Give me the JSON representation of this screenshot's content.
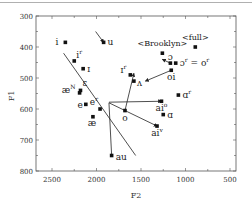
{
  "chart_data": {
    "type": "scatter",
    "title": "",
    "xlabel": "F2",
    "ylabel": "F1",
    "xlim": [
      2700,
      500
    ],
    "ylim": [
      800,
      300
    ],
    "x_reversed": true,
    "y_reversed": true,
    "xticks": [
      "2500",
      "2000",
      "1500",
      "1000",
      "500"
    ],
    "yticks": [
      "300",
      "400",
      "500",
      "600",
      "700",
      "800"
    ],
    "grid": false,
    "annotations": [
      "<Brooklyn>",
      "<full>"
    ],
    "points": [
      {
        "label": "i",
        "sup": "",
        "F2": 2350,
        "F1": 385
      },
      {
        "label": "i",
        "sup": "r",
        "F2": 2250,
        "F1": 445
      },
      {
        "label": "ɪ",
        "sup": "",
        "F2": 2150,
        "F1": 470
      },
      {
        "label": "ɛ",
        "sup": "",
        "F2": 2180,
        "F1": 540
      },
      {
        "label": "æ",
        "sup": "N",
        "F2": 2190,
        "F1": 548
      },
      {
        "label": "e",
        "sup": "",
        "F2": 2120,
        "F1": 585
      },
      {
        "label": "e",
        "sup": "r",
        "F2": 1960,
        "F1": 600
      },
      {
        "label": "æ",
        "sup": "",
        "F2": 2040,
        "F1": 625
      },
      {
        "label": "u",
        "sup": "",
        "F2": 1920,
        "F1": 385
      },
      {
        "label": "ɪ",
        "sup": "r",
        "F2": 1620,
        "F1": 490
      },
      {
        "label": "ʌ",
        "sup": "",
        "F2": 1580,
        "F1": 510
      },
      {
        "label": "o",
        "sup": "",
        "F2": 1680,
        "F1": 605
      },
      {
        "label": "au",
        "sup": "",
        "F2": 1830,
        "F1": 750
      },
      {
        "label": "ɔ",
        "sup": "",
        "F2": 1170,
        "F1": 452
      },
      {
        "label": "ɔ",
        "sup": "r",
        "suffix": " = o",
        "suffix_sup": "r",
        "F2": 1110,
        "F1": 452
      },
      {
        "label": "oi",
        "sup": "",
        "F2": 1160,
        "F1": 475
      },
      {
        "label": "ɑ",
        "sup": "r",
        "F2": 1080,
        "F1": 555
      },
      {
        "label": "ai",
        "sup": "o",
        "F2": 1270,
        "F1": 575
      },
      {
        "label": "ɑ",
        "sup": "",
        "F2": 1250,
        "F1": 618
      },
      {
        "label": "ai",
        "sup": "v",
        "F2": 1320,
        "F1": 655
      },
      {
        "label": "<Brooklyn>",
        "sup": "",
        "F2": 1260,
        "F1": 420
      },
      {
        "label": "<full>",
        "sup": "",
        "F2": 890,
        "F1": 400
      }
    ],
    "trajectories": [
      {
        "from": "u",
        "from_xy": [
          2010,
          350
        ],
        "to_xy": [
          1920,
          385
        ]
      },
      {
        "from": "i-line",
        "from_xy": [
          2370,
          420
        ],
        "to_xy": [
          1560,
          750
        ]
      },
      {
        "from": "au",
        "from_xy": [
          1830,
          750
        ],
        "to_xy": [
          1860,
          580
        ]
      },
      {
        "from": "o-to-ai-v",
        "from_xy": [
          1860,
          580
        ],
        "to_xy": [
          1320,
          655
        ]
      },
      {
        "from": "o",
        "from_xy": [
          1680,
          605
        ],
        "to_xy": [
          1580,
          485
        ]
      },
      {
        "from": "ai-o",
        "from_xy": [
          1860,
          578
        ],
        "to_xy": [
          1270,
          575
        ]
      },
      {
        "from": "oi",
        "from_xy": [
          1160,
          475
        ],
        "to_xy": [
          1450,
          510
        ]
      },
      {
        "from": "ɔ",
        "from_xy": [
          1170,
          452
        ],
        "to_xy": [
          1260,
          440
        ]
      }
    ]
  },
  "axes": {
    "x_title": "F2",
    "y_title": "F1"
  }
}
